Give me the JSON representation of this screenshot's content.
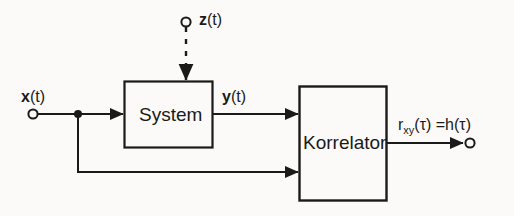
{
  "figure": {
    "type": "block-diagram",
    "background_color": "#fbfaf8",
    "line_color": "#1a1a1a",
    "blocks": [
      {
        "id": "system",
        "label": "System",
        "x": 124,
        "y": 81,
        "w": 88,
        "h": 67
      },
      {
        "id": "korrelator",
        "label": "Korrelator",
        "x": 299,
        "y": 86,
        "w": 87,
        "h": 114
      }
    ],
    "signals": {
      "input_x": "x(t)",
      "input_x_var": "x",
      "input_x_arg": "(t)",
      "noise_z": "z(t)",
      "noise_z_var": "z",
      "noise_z_arg": "(t)",
      "mid_y": "y(t)",
      "mid_y_var": "y",
      "mid_y_arg": "(t)",
      "output": "r_xy(τ) = h(τ)",
      "output_r": "r",
      "output_sub": "xy",
      "output_tail": "(τ) =h(τ)"
    },
    "terminals": [
      {
        "id": "x-input-terminal",
        "x": 33,
        "y": 114,
        "style": "open-circle"
      },
      {
        "id": "z-input-terminal",
        "x": 186,
        "y": 22,
        "style": "open-circle"
      },
      {
        "id": "output-terminal",
        "x": 471,
        "y": 143,
        "style": "open-circle"
      }
    ],
    "junctions": [
      {
        "id": "x-branch-node",
        "x": 78,
        "y": 114,
        "style": "filled-dot"
      }
    ],
    "edges": [
      {
        "id": "x-to-system",
        "from": "x-input-terminal",
        "to": "system",
        "style": "solid",
        "arrow": true
      },
      {
        "id": "z-to-system",
        "from": "z-input-terminal",
        "to": "system",
        "style": "dashed",
        "arrow": true
      },
      {
        "id": "system-to-korrelator",
        "from": "system",
        "to": "korrelator",
        "style": "solid",
        "arrow": true,
        "label": "y(t)"
      },
      {
        "id": "x-branch-to-korrelator",
        "from": "x-branch-node",
        "to": "korrelator",
        "style": "solid",
        "arrow": true
      },
      {
        "id": "korrelator-to-output",
        "from": "korrelator",
        "to": "output-terminal",
        "style": "solid",
        "arrow": true,
        "label": "r_xy(τ) = h(τ)"
      }
    ]
  }
}
